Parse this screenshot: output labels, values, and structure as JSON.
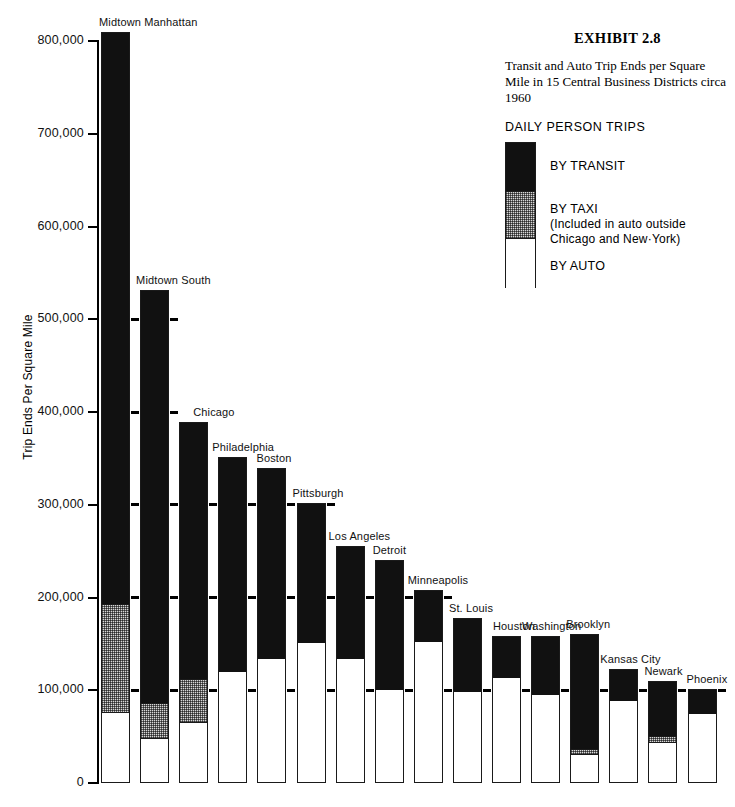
{
  "header": {
    "exhibit_number": "EXHIBIT 2.8",
    "description": "Transit and Auto Trip Ends per Square Mile in 15 Central Business Districts circa 1960"
  },
  "legend": {
    "heading": "DAILY PERSON TRIPS",
    "items": [
      {
        "label": "BY TRANSIT",
        "note": "",
        "swatch": "transit",
        "color": "#111111"
      },
      {
        "label": "BY TAXI",
        "note": "(Included in auto outside Chicago and New·York)",
        "swatch": "taxi",
        "color": "#d8d8d8"
      },
      {
        "label": "BY AUTO",
        "note": "",
        "swatch": "auto",
        "color": "#ffffff"
      }
    ]
  },
  "chart_data": {
    "type": "bar",
    "subtype": "stacked",
    "title": "Transit and Auto Trip Ends per Square Mile in 15 Central Business Districts circa 1960",
    "xlabel": "",
    "ylabel": "Trip Ends Per Square Mile",
    "ylim": [
      0,
      800000
    ],
    "ytick_values": [
      0,
      100000,
      200000,
      300000,
      400000,
      500000,
      600000,
      700000,
      800000
    ],
    "ytick_labels": [
      "0",
      "100,000",
      "200,000",
      "300,000",
      "400,000",
      "500,000",
      "600,000",
      "700,000",
      "800,000"
    ],
    "grid": false,
    "gridline_marks_between_bars": [
      100000,
      200000,
      300000,
      400000,
      500000
    ],
    "legend_position": "top-right",
    "categories": [
      "Midtown Manhattan",
      "Midtown South",
      "Chicago",
      "Philadelphia",
      "Boston",
      "Pittsburgh",
      "Los Angeles",
      "Detroit",
      "Minneapolis",
      "St. Louis",
      "Houston",
      "Washington",
      "Brooklyn",
      "Kansas City",
      "Newark",
      "Phoenix"
    ],
    "series": [
      {
        "name": "BY AUTO",
        "color": "#ffffff",
        "values": [
          77000,
          48000,
          66000,
          121000,
          135000,
          152000,
          135000,
          101000,
          153000,
          99000,
          114000,
          96000,
          31000,
          89000,
          44000,
          76000
        ]
      },
      {
        "name": "BY TAXI",
        "color": "#d8d8d8",
        "values": [
          117000,
          39000,
          47000,
          0,
          0,
          0,
          0,
          0,
          0,
          0,
          0,
          0,
          7000,
          0,
          8000,
          0
        ]
      },
      {
        "name": "BY TRANSIT",
        "color": "#111111",
        "values": [
          616000,
          444000,
          276000,
          230000,
          205000,
          150000,
          120000,
          139000,
          55000,
          79000,
          45000,
          63000,
          123000,
          34000,
          58000,
          25000
        ]
      }
    ],
    "totals": [
      810000,
      531000,
      389000,
      351000,
      340000,
      302000,
      255000,
      240000,
      208000,
      178000,
      159000,
      159000,
      161000,
      123000,
      110000,
      101000
    ]
  }
}
